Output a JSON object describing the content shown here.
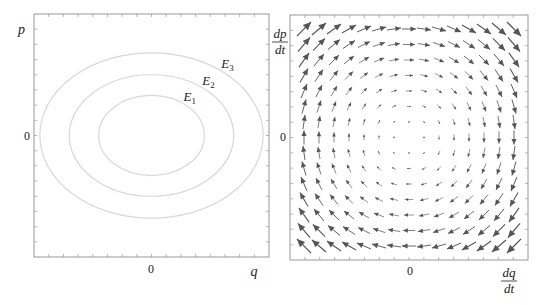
{
  "chart_data": [
    {
      "type": "line",
      "title": "",
      "description": "Phase-space contour plot of energy levels (concentric ellipses)",
      "xlabel": "q",
      "ylabel": "p",
      "x_ticks": [
        "0"
      ],
      "y_ticks": [
        "0"
      ],
      "xlim": [
        -1,
        1
      ],
      "ylim": [
        -1,
        1
      ],
      "grid": false,
      "line_color": "#d8d8d8",
      "series": [
        {
          "name": "E1",
          "label_main": "E",
          "label_sub": "1",
          "shape": "ellipse",
          "center": [
            0,
            0
          ],
          "semi_axes": [
            0.45,
            0.33
          ]
        },
        {
          "name": "E2",
          "label_main": "E",
          "label_sub": "2",
          "shape": "ellipse",
          "center": [
            0,
            0
          ],
          "semi_axes": [
            0.7,
            0.5
          ]
        },
        {
          "name": "E3",
          "label_main": "E",
          "label_sub": "3",
          "shape": "ellipse",
          "center": [
            0,
            0
          ],
          "semi_axes": [
            0.95,
            0.68
          ]
        }
      ]
    },
    {
      "type": "scatter",
      "subtype": "vector-field",
      "title": "",
      "description": "Phase-space velocity field showing clockwise circulation",
      "xlabel_num": "dq",
      "xlabel_den": "dt",
      "ylabel_num": "dp",
      "ylabel_den": "dt",
      "x_ticks": [
        "0"
      ],
      "y_ticks": [
        "0"
      ],
      "xlim": [
        -1,
        1
      ],
      "ylim": [
        -1,
        1
      ],
      "grid_points": 15,
      "field": "dq/dt = p, dp/dt = -q (clockwise rotation)",
      "arrow_color": "#555555",
      "grid": false
    }
  ]
}
